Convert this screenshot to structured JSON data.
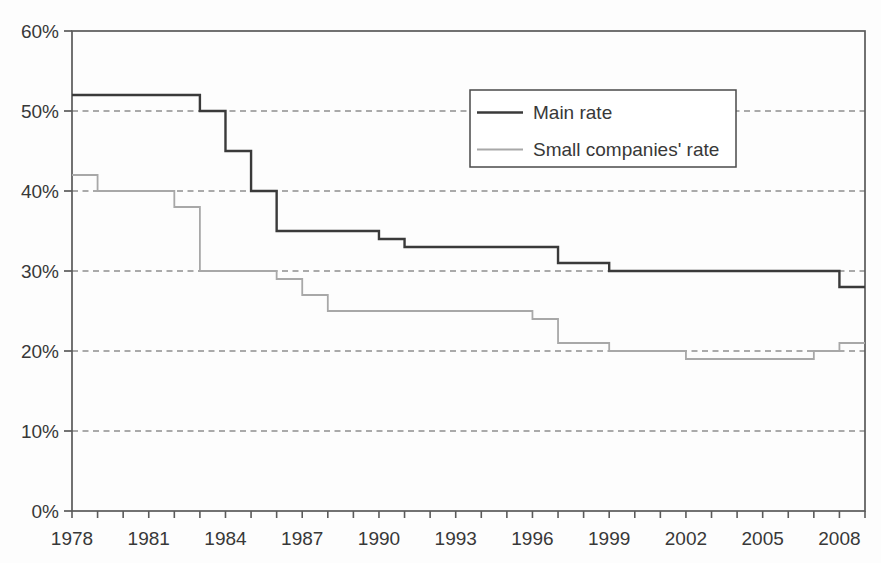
{
  "chart_data": {
    "type": "line",
    "subtype": "step",
    "title": "",
    "xlabel": "",
    "ylabel": "",
    "x_range": [
      1978,
      2009
    ],
    "ylim": [
      0,
      60
    ],
    "y_ticks": [
      0,
      10,
      20,
      30,
      40,
      50,
      60
    ],
    "y_tick_labels": [
      "0%",
      "10%",
      "20%",
      "30%",
      "40%",
      "50%",
      "60%"
    ],
    "x_labeled_years": [
      1978,
      1981,
      1984,
      1987,
      1990,
      1993,
      1996,
      1999,
      2002,
      2005,
      2008
    ],
    "x_minor_tick_every_year": true,
    "grid": "horizontal-dashed",
    "legend_position": "upper-right-inside",
    "years": [
      1978,
      1979,
      1980,
      1981,
      1982,
      1983,
      1984,
      1985,
      1986,
      1987,
      1988,
      1989,
      1990,
      1991,
      1992,
      1993,
      1994,
      1995,
      1996,
      1997,
      1998,
      1999,
      2000,
      2001,
      2002,
      2003,
      2004,
      2005,
      2006,
      2007,
      2008
    ],
    "series": [
      {
        "name": "Main rate",
        "color": "#3a3a3a",
        "stroke_width": 2.4,
        "values": [
          52,
          52,
          52,
          52,
          52,
          50,
          45,
          40,
          35,
          35,
          35,
          35,
          34,
          33,
          33,
          33,
          33,
          33,
          33,
          31,
          31,
          30,
          30,
          30,
          30,
          30,
          30,
          30,
          30,
          30,
          28
        ]
      },
      {
        "name": "Small companies' rate",
        "color": "#a8a8a8",
        "stroke_width": 1.8,
        "values": [
          42,
          40,
          40,
          40,
          38,
          30,
          30,
          30,
          29,
          27,
          25,
          25,
          25,
          25,
          25,
          25,
          25,
          25,
          24,
          21,
          21,
          20,
          20,
          20,
          19,
          19,
          19,
          19,
          19,
          20,
          21
        ]
      }
    ],
    "colors": {
      "frame": "#5a5a5a",
      "gridline": "#8f8f8f",
      "tick": "#5a5a5a",
      "text": "#383838",
      "legend_border": "#4a4a4a",
      "legend_background": "#ffffff"
    }
  },
  "legend": {
    "items": [
      {
        "label": "Main rate"
      },
      {
        "label": "Small companies' rate"
      }
    ]
  }
}
